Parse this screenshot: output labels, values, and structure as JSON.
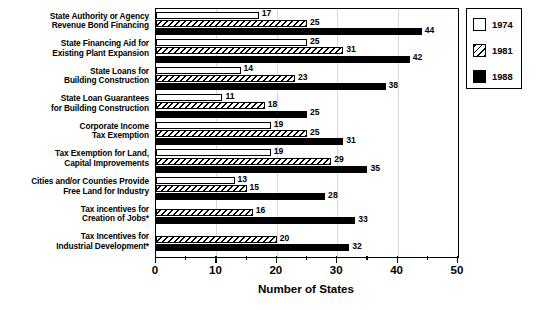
{
  "chart_data": {
    "type": "bar",
    "orientation": "horizontal",
    "title": "",
    "xlabel": "Number of States",
    "ylabel": "",
    "xlim": [
      0,
      50
    ],
    "xticks": [
      0,
      10,
      20,
      30,
      40,
      50
    ],
    "xtick_labels": [
      "0",
      "10",
      "20",
      "30",
      "40",
      "50"
    ],
    "minor_xticks": [
      5,
      15,
      25,
      35,
      45
    ],
    "grid": true,
    "legend_position": "top-right outside",
    "categories": [
      "State Authority or Agency\nRevenue Bond Financing",
      "State Financing Aid for\nExisting Plant Expansion",
      "State Loans for\nBuilding Construction",
      "State Loan Guarantees\nfor Building Construction",
      "Corporate Income\nTax Exemption",
      "Tax Exemption for Land,\nCapital Improvements",
      "Cities and/or Counties Provide\nFree Land for Industry",
      "Tax incentives for\nCreation of Jobs*",
      "Tax Incentives for\nIndustrial Development*"
    ],
    "series": [
      {
        "name": "1974",
        "color": "#ffffff",
        "pattern": "solid-white",
        "values": [
          17,
          25,
          14,
          11,
          19,
          19,
          13,
          null,
          null
        ]
      },
      {
        "name": "1981",
        "color": "#ffffff",
        "pattern": "diagonal-hatch",
        "values": [
          25,
          31,
          23,
          18,
          25,
          29,
          15,
          16,
          20
        ]
      },
      {
        "name": "1988",
        "color": "#000000",
        "pattern": "solid-black",
        "values": [
          44,
          42,
          38,
          25,
          31,
          35,
          28,
          33,
          32
        ]
      }
    ]
  },
  "legend": {
    "entries": [
      {
        "label": "1974"
      },
      {
        "label": "1981"
      },
      {
        "label": "1988"
      }
    ]
  },
  "axis": {
    "x_title": "Number of States"
  },
  "footnote": "*"
}
